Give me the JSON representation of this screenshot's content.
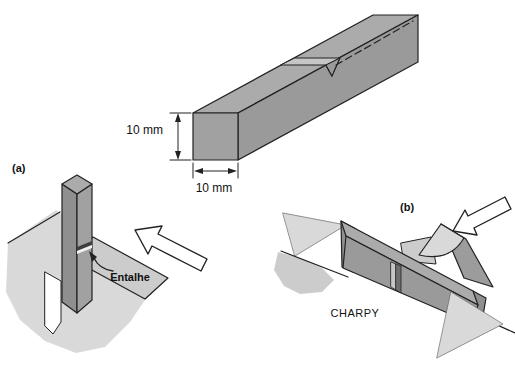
{
  "figure": {
    "specimen": {
      "height_label": "10 mm",
      "width_label": "10 mm"
    },
    "izod": {
      "panel_label": "(a)",
      "notch_label": "Entalhe"
    },
    "charpy": {
      "panel_label": "(b)",
      "name_label": "CHARPY"
    },
    "icons": {
      "impact_arrow": "hollow-block-arrow",
      "dimension_arrow": "double-headed-arrow",
      "notch_pointer": "curved-arrow"
    },
    "colors": {
      "bar_top": "#ababab",
      "bar_side": "#9a9a9a",
      "bar_front": "#a1a1a1",
      "bar_dark_face": "#8f8f8f",
      "notch_light": "#c6c6c6",
      "fixture_light": "#d9d9d9",
      "fixture_mid": "#cccccc",
      "striker_side": "#9c9c9c",
      "outline": "#222222",
      "text": "#111111"
    }
  }
}
